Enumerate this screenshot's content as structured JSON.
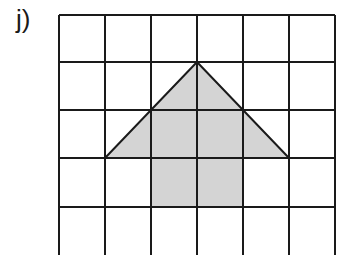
{
  "problem": {
    "label": "j)"
  },
  "grid": {
    "columns": 6,
    "rows": 5,
    "x_lines": [
      59,
      105,
      151,
      197,
      243,
      289,
      335
    ],
    "y_lines": [
      15,
      62,
      110,
      158,
      207,
      256
    ],
    "line_color": "#1a1a1a"
  },
  "shape": {
    "description": "Arrow pointing up: triangle head over rectangular stem",
    "fill_color": "#d4d4d4",
    "stroke_color": "#1a1a1a",
    "points_grid": [
      [
        3,
        1
      ],
      [
        5,
        3
      ],
      [
        4,
        3
      ],
      [
        4,
        4
      ],
      [
        2,
        4
      ],
      [
        2,
        3
      ],
      [
        1,
        3
      ]
    ]
  }
}
